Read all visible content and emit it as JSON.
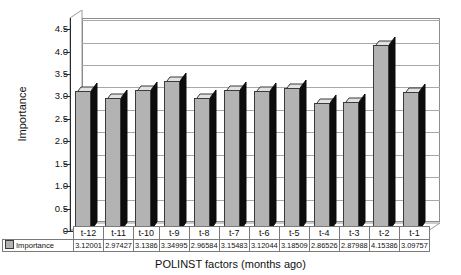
{
  "chart_data": {
    "type": "bar",
    "title": "",
    "xlabel": "POLINST factors (months ago)",
    "ylabel": "Importance",
    "categories": [
      "t-12",
      "t-11",
      "t-10",
      "t-9",
      "t-8",
      "t-7",
      "t-6",
      "t-5",
      "t-4",
      "t-3",
      "t-2",
      "t-1"
    ],
    "series": [
      {
        "name": "Importance",
        "values": [
          3.12001,
          2.97427,
          3.1386,
          3.34995,
          2.96584,
          3.15483,
          3.12044,
          3.18509,
          2.86526,
          2.87988,
          4.15386,
          3.09757
        ],
        "value_labels": [
          "3.12001",
          "2.97427",
          "3.1386",
          "3.34995",
          "2.96584",
          "3.15483",
          "3.12044",
          "3.18509",
          "2.86526",
          "2.87988",
          "4.15386",
          "3.09757"
        ]
      }
    ],
    "ylim": [
      0,
      4.5
    ],
    "ytick_labels": [
      "4.5",
      "4.0",
      "3.5",
      "3.0",
      "2.5",
      "2.0",
      "1.5",
      "1.0",
      "0.5",
      "0"
    ],
    "ytick_values": [
      4.5,
      4.0,
      3.5,
      3.0,
      2.5,
      2.0,
      1.5,
      1.0,
      0.5,
      0
    ],
    "grid": true,
    "legend_position": "data-table-row-header",
    "style": "3d-column",
    "data_table_visible": true,
    "colors": {
      "bar_front": "#b3b3b3",
      "bar_side": "#0d0d0d",
      "bar_top": "#e2e2e2",
      "gridline": "#a8a8a8",
      "axis": "#2b2b2b",
      "text": "#111111",
      "background": "#ffffff"
    }
  },
  "legend": {
    "swatch_name": "importance-color-swatch",
    "label": "Importance"
  }
}
